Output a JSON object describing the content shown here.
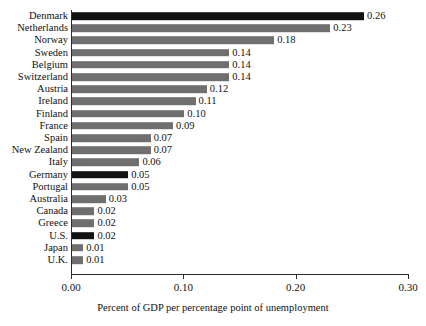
{
  "chart_data": {
    "type": "bar",
    "orientation": "horizontal",
    "title": "",
    "xlabel": "Percent of GDP per percentage point of unemployment",
    "ylabel": "",
    "xlim": [
      0.0,
      0.3
    ],
    "xticks": [
      "0.00",
      "0.10",
      "0.20",
      "0.30"
    ],
    "xtick_values": [
      0.0,
      0.1,
      0.2,
      0.3
    ],
    "grid": false,
    "legend": false,
    "categories": [
      "Denmark",
      "Netherlands",
      "Norway",
      "Sweden",
      "Belgium",
      "Switzerland",
      "Austria",
      "Ireland",
      "Finland",
      "France",
      "Spain",
      "New Zealand",
      "Italy",
      "Germany",
      "Portugal",
      "Australia",
      "Canada",
      "Greece",
      "U.S.",
      "Japan",
      "U.K."
    ],
    "values": [
      0.26,
      0.23,
      0.18,
      0.14,
      0.14,
      0.14,
      0.12,
      0.11,
      0.1,
      0.09,
      0.07,
      0.07,
      0.06,
      0.05,
      0.05,
      0.03,
      0.02,
      0.02,
      0.02,
      0.01,
      0.01
    ],
    "value_labels": [
      "0.26",
      "0.23",
      "0.18",
      "0.14",
      "0.14",
      "0.14",
      "0.12",
      "0.11",
      "0.10",
      "0.09",
      "0.07",
      "0.07",
      "0.06",
      "0.05",
      "0.05",
      "0.03",
      "0.02",
      "0.02",
      "0.02",
      "0.01",
      "0.01"
    ],
    "bar_colors": [
      "black",
      "gray",
      "gray",
      "gray",
      "gray",
      "gray",
      "gray",
      "gray",
      "gray",
      "gray",
      "gray",
      "gray",
      "gray",
      "black",
      "gray",
      "gray",
      "gray",
      "gray",
      "black",
      "gray",
      "gray"
    ],
    "colors": {
      "gray": "#6f6f6f",
      "black": "#121212",
      "axis": "#2b2b2b",
      "text": "#111111",
      "background": "#ffffff"
    }
  }
}
